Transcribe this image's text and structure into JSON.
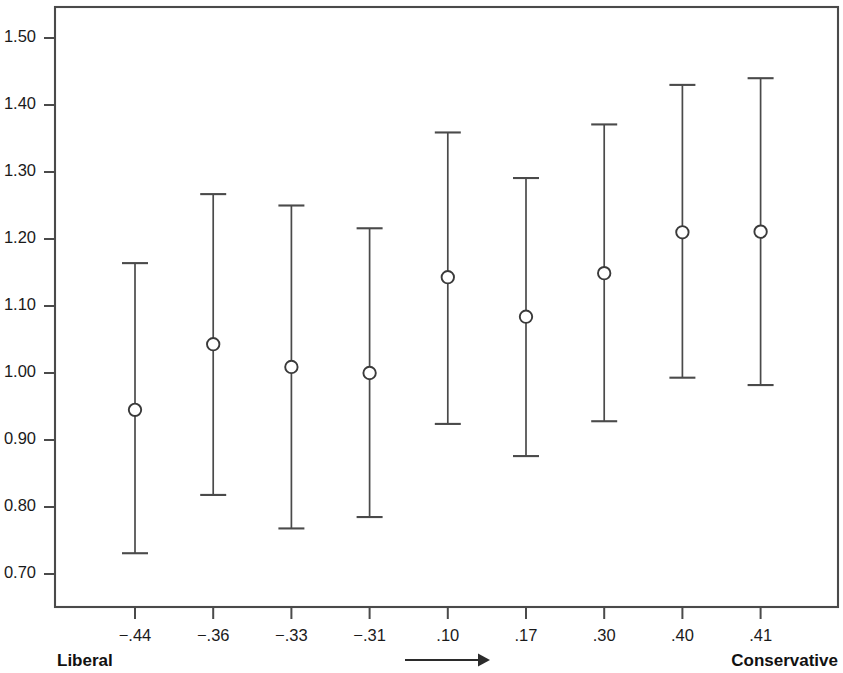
{
  "chart_data": {
    "type": "scatter",
    "title": "",
    "subtitle": "",
    "xlabel": "",
    "ylabel": "",
    "grid": false,
    "legend": null,
    "categories": [
      "-.44",
      "-.36",
      "-.33",
      "-.31",
      ".10",
      ".17",
      ".30",
      ".40",
      ".41"
    ],
    "x_tick_labels": [
      "-.44",
      "-.36",
      "-.33",
      "-.31",
      ".10",
      ".17",
      ".30",
      ".40",
      ".41"
    ],
    "y_tick_labels": [
      "1.50",
      "1.40",
      "1.30",
      "1.20",
      "1.10",
      "1.00",
      "0.90",
      "0.80",
      "0.70"
    ],
    "y_tick_values": [
      1.5,
      1.4,
      1.3,
      1.2,
      1.1,
      1.0,
      0.9,
      0.8,
      0.7
    ],
    "ylim": [
      0.655,
      1.555
    ],
    "values": [
      0.945,
      1.043,
      1.009,
      1.0,
      1.143,
      1.084,
      1.149,
      1.21,
      1.211
    ],
    "ci_lower": [
      0.731,
      0.818,
      0.768,
      0.785,
      0.924,
      0.876,
      0.928,
      0.993,
      0.982
    ],
    "ci_upper": [
      1.164,
      1.267,
      1.25,
      1.216,
      1.359,
      1.291,
      1.371,
      1.43,
      1.44
    ],
    "points": [
      {
        "x_label": "-.44",
        "value": 0.945,
        "lower": 0.731,
        "upper": 1.164
      },
      {
        "x_label": "-.36",
        "value": 1.043,
        "lower": 0.818,
        "upper": 1.267
      },
      {
        "x_label": "-.33",
        "value": 1.009,
        "lower": 0.768,
        "upper": 1.25
      },
      {
        "x_label": "-.31",
        "value": 1.0,
        "lower": 0.785,
        "upper": 1.216
      },
      {
        "x_label": ".10",
        "value": 1.143,
        "lower": 0.924,
        "upper": 1.359
      },
      {
        "x_label": ".17",
        "value": 1.084,
        "lower": 0.876,
        "upper": 1.291
      },
      {
        "x_label": ".30",
        "value": 1.149,
        "lower": 0.928,
        "upper": 1.371
      },
      {
        "x_label": ".40",
        "value": 1.21,
        "lower": 0.993,
        "upper": 1.43
      },
      {
        "x_label": ".41",
        "value": 1.211,
        "lower": 0.982,
        "upper": 1.44
      }
    ],
    "annotations": {
      "left_endpoint": "Liberal",
      "right_endpoint": "Conservative",
      "direction_arrow": "right-arrow"
    },
    "colors": {
      "axis": "#4a4a4a",
      "marker_stroke": "#3a3a3a",
      "marker_fill": "#ffffff",
      "whisker": "#4a4a4a",
      "text": "#1a1a1a",
      "background": "#ffffff"
    }
  }
}
